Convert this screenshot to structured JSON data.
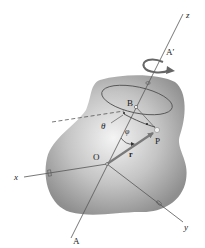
{
  "figure": {
    "labels": {
      "z": "z",
      "x": "x",
      "y": "y",
      "A": "A",
      "A_prime": "A′",
      "B": "B",
      "O": "O",
      "P": "P",
      "r": "r",
      "theta": "θ",
      "phi": "φ"
    },
    "colors": {
      "body_light": "#f2f2f2",
      "body_dark": "#8e8e8e",
      "line": "#444444",
      "vector": "#7a7a7a"
    }
  }
}
